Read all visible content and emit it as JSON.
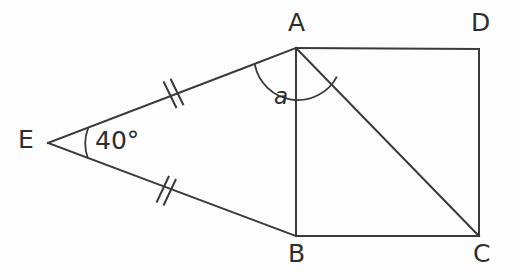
{
  "figure": {
    "kind": "geometry-diagram",
    "background_color": "#fdfdfd",
    "stroke_color": "#3a3a3a",
    "text_color": "#2e2e2e",
    "width": 520,
    "height": 278
  },
  "points": {
    "A": {
      "label": "A",
      "x": 296,
      "y": 48
    },
    "B": {
      "label": "B",
      "x": 296,
      "y": 236
    },
    "C": {
      "label": "C",
      "x": 479,
      "y": 236
    },
    "D": {
      "label": "D",
      "x": 479,
      "y": 49
    },
    "E": {
      "label": "E",
      "x": 48,
      "y": 143
    }
  },
  "segments": [
    {
      "name": "AD",
      "from": "A",
      "to": "D"
    },
    {
      "name": "DC",
      "from": "D",
      "to": "C"
    },
    {
      "name": "CB",
      "from": "C",
      "to": "B"
    },
    {
      "name": "BA",
      "from": "B",
      "to": "A"
    },
    {
      "name": "AC",
      "from": "A",
      "to": "C",
      "role": "diagonal"
    },
    {
      "name": "EA",
      "from": "E",
      "to": "A",
      "ticks": 2
    },
    {
      "name": "EB",
      "from": "E",
      "to": "B",
      "ticks": 2
    }
  ],
  "angles": {
    "at_E": {
      "label": "40°",
      "value": 40,
      "unit": "degrees",
      "vertex": "E",
      "between": [
        "EA",
        "EB"
      ]
    },
    "at_A": {
      "label": "a",
      "vertex": "A",
      "between": [
        "AE",
        "AC"
      ],
      "style": "italic"
    }
  },
  "tick_marks": {
    "count": 2,
    "meaning": "congruent-sides",
    "on_segments": [
      "EA",
      "EB"
    ]
  }
}
